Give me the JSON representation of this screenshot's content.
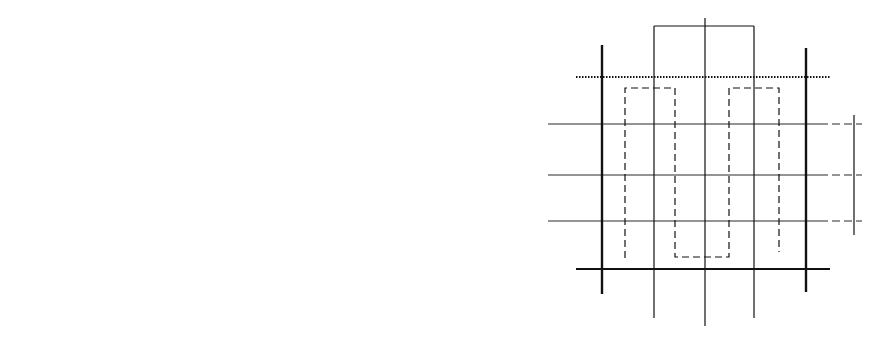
{
  "panels": {
    "a": {
      "label": "a)",
      "title": "Counting chamber grid",
      "corner_label": "A",
      "large_squares": [
        {
          "id": "1",
          "x": 192,
          "y": 83
        },
        {
          "id": "2",
          "x": 368,
          "y": 83
        },
        {
          "id": "3",
          "x": 368,
          "y": 263
        },
        {
          "id": "4",
          "x": 192,
          "y": 263
        },
        {
          "id": "5",
          "x": 281,
          "y": 143
        }
      ],
      "small_squares": [
        {
          "id": "A",
          "x": 241,
          "y": 133
        },
        {
          "id": "B",
          "x": 320,
          "y": 133
        },
        {
          "id": "C",
          "x": 320,
          "y": 213
        },
        {
          "id": "D",
          "x": 241,
          "y": 213
        },
        {
          "id": "E",
          "x": 281,
          "y": 173
        }
      ]
    },
    "b": {
      "label": "b)",
      "title": "Counting rule: filled cells counted, open cells excluded, dashed arrow shows counting path",
      "legend": {
        "filled_circle": "counted cell",
        "open_circle": "not counted cell",
        "dashed_arrow": "counting path"
      }
    }
  }
}
